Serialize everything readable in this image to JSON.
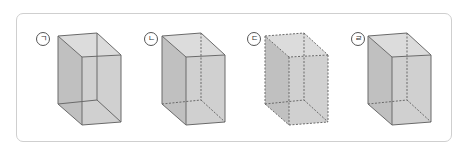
{
  "figures": [
    {
      "label": "㉠",
      "label_x": 36,
      "label_y": 32,
      "offset_x": 0,
      "hidden_edges": "solid",
      "visible_edges": "solid"
    },
    {
      "label": "㉡",
      "label_x": 144,
      "label_y": 32,
      "offset_x": 104,
      "hidden_edges": "dashed",
      "visible_edges": "solid"
    },
    {
      "label": "㉢",
      "label_x": 247,
      "label_y": 32,
      "offset_x": 207,
      "hidden_edges": "dashed",
      "visible_edges": "dashed"
    },
    {
      "label": "㉣",
      "label_x": 351,
      "label_y": 32,
      "offset_x": 310,
      "hidden_edges": "dashed",
      "visible_edges": "solid"
    }
  ],
  "colors": {
    "face_fill": "#c8c8c8",
    "side_fill": "#b5b5b5",
    "top_fill": "#d6d6d6",
    "edge": "#6a6a6a",
    "frame_border": "#cfcfcf"
  }
}
